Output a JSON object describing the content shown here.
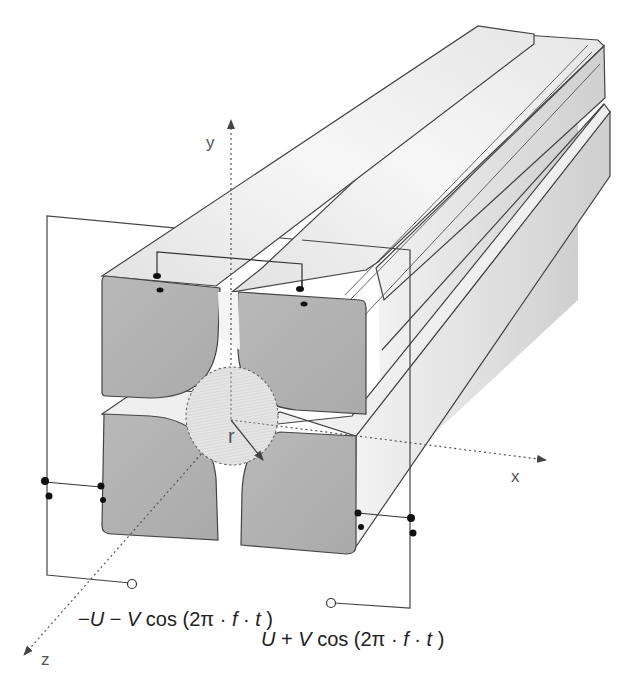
{
  "diagram": {
    "axes": {
      "x": "x",
      "y": "y",
      "z": "z"
    },
    "radius_label": "r",
    "voltages": {
      "negative": {
        "sign": "−",
        "U": "U",
        "minus": " − ",
        "V": "V",
        "cos": " cos (2π · ",
        "f": "f",
        "dot": " · ",
        "t": "t",
        "close": " )"
      },
      "positive": {
        "U": "U",
        "plus": " + ",
        "V": "V",
        "cos": " cos (2π · ",
        "f": "f",
        "dot": " · ",
        "t": "t",
        "close": " )"
      }
    },
    "colors": {
      "rod_face": "#b4b4b4",
      "rod_top": "#ececec",
      "rod_side": "#dcdcdc",
      "outline": "#444444",
      "wire": "#333333",
      "terminal_dot": "#111111"
    }
  }
}
